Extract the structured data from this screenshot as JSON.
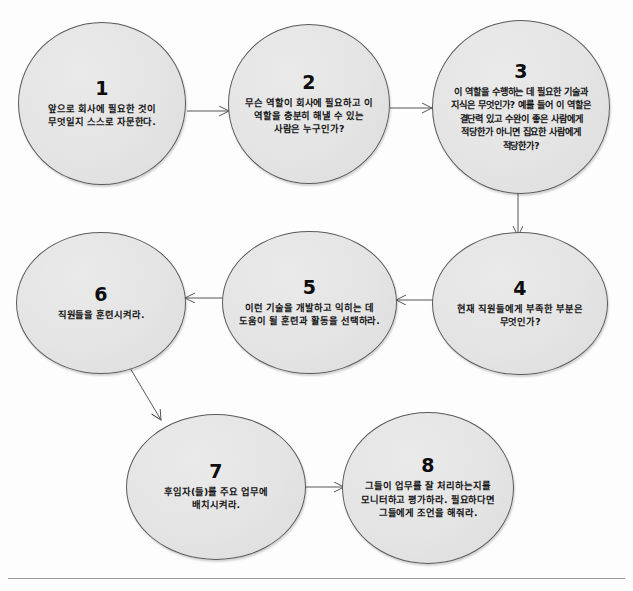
{
  "diagram": {
    "nodes": [
      {
        "number": "1",
        "text": "앞으로 회사에 필요한 것이 무엇일지 스스로 자문한다."
      },
      {
        "number": "2",
        "text": "무슨 역할이 회사에 필요하고 이 역할을 충분히 해낼 수 있는 사람은 누구인가?"
      },
      {
        "number": "3",
        "text": "이 역할을 수행하는 데 필요한 기술과 지식은 무엇인가? 예를 들어 이 역할은 결단력 있고 수완이 좋은 사람에게 적당한가 아니면 집요한 사람에게 적당한가?"
      },
      {
        "number": "4",
        "text": "현재 직원들에게 부족한 부분은 무엇인가?"
      },
      {
        "number": "5",
        "text": "이런 기술을 개발하고 익히는 데 도움이 될 훈련과 활동을 선택하라."
      },
      {
        "number": "6",
        "text": "직원들을 훈련시켜라."
      },
      {
        "number": "7",
        "text": "후임자(들)를 주요 업무에 배치시켜라."
      },
      {
        "number": "8",
        "text": "그들이 업무를 잘 처리하는지를 모니터하고 평가하라. 필요하다면 그들에게 조언을 해줘라."
      }
    ],
    "connectors": [
      {
        "from": "1",
        "to": "2",
        "direction": "right"
      },
      {
        "from": "2",
        "to": "3",
        "direction": "right"
      },
      {
        "from": "3",
        "to": "4",
        "direction": "down"
      },
      {
        "from": "4",
        "to": "5",
        "direction": "left"
      },
      {
        "from": "5",
        "to": "6",
        "direction": "left"
      },
      {
        "from": "6",
        "to": "7",
        "direction": "down-right"
      },
      {
        "from": "7",
        "to": "8",
        "direction": "right"
      }
    ],
    "colors": {
      "node_fill": "#e4e4e4",
      "node_stroke": "#5a5a5a",
      "text": "#121212",
      "arrow": "#555555",
      "rule": "#9a9a9a",
      "page_background": "#fdfdfd"
    }
  }
}
